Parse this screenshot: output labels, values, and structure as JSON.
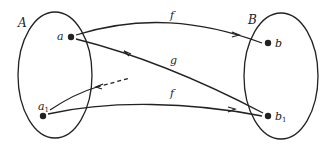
{
  "diagram": {
    "sets": [
      {
        "id": "A",
        "label": "A"
      },
      {
        "id": "B",
        "label": "B"
      }
    ],
    "points": [
      {
        "id": "a",
        "label": "a",
        "set": "A"
      },
      {
        "id": "a1",
        "label": "a",
        "subscript": "1",
        "set": "A"
      },
      {
        "id": "b",
        "label": "b",
        "set": "B"
      },
      {
        "id": "b1",
        "label": "b",
        "subscript": "1",
        "set": "B"
      }
    ],
    "arrows": [
      {
        "from": "a",
        "to": "b",
        "label": "f",
        "style": "solid"
      },
      {
        "from": "b1",
        "to": "a",
        "label": "g",
        "style": "solid"
      },
      {
        "from": "a1",
        "to": "b1",
        "label": "f",
        "style": "solid"
      },
      {
        "from": "outside",
        "to": "a1",
        "label": "",
        "style": "dashed"
      }
    ],
    "colors": {
      "stroke": "#222222",
      "background": "#ffffff"
    }
  }
}
